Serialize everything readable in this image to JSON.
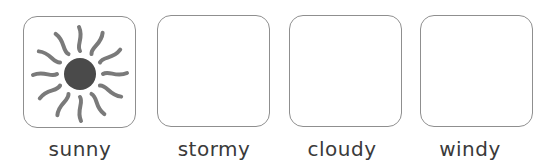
{
  "cards": [
    {
      "id": "sunny",
      "label": "sunny",
      "icon": "sun-icon",
      "filled": true
    },
    {
      "id": "stormy",
      "label": "stormy",
      "icon": null,
      "filled": false
    },
    {
      "id": "cloudy",
      "label": "cloudy",
      "icon": null,
      "filled": false
    },
    {
      "id": "windy",
      "label": "windy",
      "icon": null,
      "filled": false
    }
  ],
  "colors": {
    "border": "#8f8f8f",
    "sun_core": "#4a4a4a",
    "sun_rays": "#7a7a7a",
    "label_text": "#3a3a3a"
  }
}
